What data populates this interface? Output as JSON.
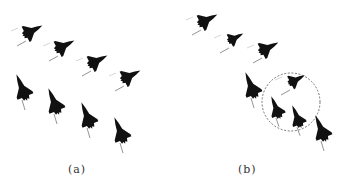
{
  "figure": {
    "panels": [
      {
        "id": "a",
        "label": "(a)",
        "description": "Two rows of four aircraft in regular formation",
        "aircraft": [
          {
            "x": 32,
            "y": 31,
            "heading": "up-right",
            "scale": 1.0
          },
          {
            "x": 64,
            "y": 46,
            "heading": "up-right",
            "scale": 1.0
          },
          {
            "x": 97,
            "y": 61,
            "heading": "up-right",
            "scale": 1.0
          },
          {
            "x": 130,
            "y": 76,
            "heading": "up-right",
            "scale": 1.0
          },
          {
            "x": 22,
            "y": 88,
            "heading": "up-left",
            "scale": 1.0
          },
          {
            "x": 54,
            "y": 102,
            "heading": "up-left",
            "scale": 1.0
          },
          {
            "x": 87,
            "y": 116,
            "heading": "up-left",
            "scale": 1.0
          },
          {
            "x": 120,
            "y": 131,
            "heading": "up-left",
            "scale": 1.0
          }
        ]
      },
      {
        "id": "b",
        "label": "(b)",
        "description": "Formation with a group of three aircraft circled by a dashed ellipse",
        "aircraft": [
          {
            "x": 207,
            "y": 20,
            "heading": "up-right",
            "scale": 1.0
          },
          {
            "x": 235,
            "y": 38,
            "heading": "up-right",
            "scale": 0.8
          },
          {
            "x": 268,
            "y": 48,
            "heading": "up-right",
            "scale": 1.0
          },
          {
            "x": 296,
            "y": 80,
            "heading": "up-right",
            "scale": 0.85
          },
          {
            "x": 251,
            "y": 86,
            "heading": "up-left",
            "scale": 1.0
          },
          {
            "x": 276,
            "y": 108,
            "heading": "up-left",
            "scale": 0.85
          },
          {
            "x": 297,
            "y": 117,
            "heading": "up-left",
            "scale": 0.85
          },
          {
            "x": 321,
            "y": 129,
            "heading": "up-left",
            "scale": 1.0
          }
        ],
        "highlight": {
          "shape": "dashed-circle",
          "cx": 291,
          "cy": 102,
          "rx": 29,
          "ry": 29,
          "color": "#666666"
        }
      }
    ],
    "colors": {
      "aircraft": "#111111",
      "trail": "#888888",
      "label": "#333333",
      "background": "#ffffff"
    }
  }
}
